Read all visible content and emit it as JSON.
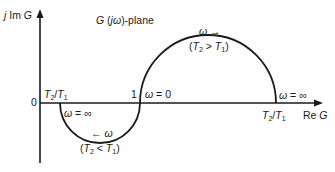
{
  "diagram": {
    "plane_title": "G (jω)-plane",
    "axes": {
      "imag_label": "j Im G",
      "real_label": "Re G",
      "origin_label": "0"
    },
    "points": {
      "one_label": "1",
      "left_ratio_label": "T2/T1",
      "right_ratio_label": "T2/T1"
    },
    "upper_arc": {
      "direction_label": "ω →",
      "condition_label": "(T2 > T1)",
      "start_label": "ω = 0",
      "end_label": "ω = ∞"
    },
    "lower_arc": {
      "direction_label": "← ω",
      "condition_label": "(T2 < T1)",
      "end_label": "ω = ∞"
    },
    "colors": {
      "stroke": "#1a1a1a",
      "background": "#ffffff"
    }
  }
}
